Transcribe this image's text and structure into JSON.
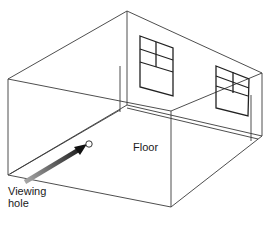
{
  "diagram": {
    "labels": {
      "floor": "Floor",
      "viewing_hole_line1": "Viewing",
      "viewing_hole_line2": "hole"
    },
    "colors": {
      "line": "#3a3a3a",
      "window": "#222222",
      "arrow_dark": "#111111",
      "arrow_light": "#9a9a9a"
    }
  }
}
